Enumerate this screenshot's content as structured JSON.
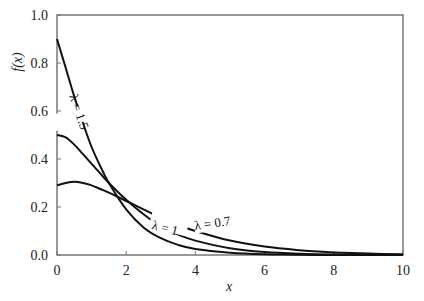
{
  "chart_data": {
    "type": "line",
    "title": "",
    "xlabel": "x",
    "ylabel": "f(x)",
    "xlim": [
      0,
      10
    ],
    "ylim": [
      0,
      1.0
    ],
    "grid": false,
    "legend": "inline curve labels",
    "x_ticks": [
      "0",
      "2",
      "4",
      "6",
      "8",
      "10"
    ],
    "y_ticks": [
      "0.0",
      "0.2",
      "0.4",
      "0.6",
      "0.8",
      "1.0"
    ],
    "x": [
      0,
      0.25,
      0.5,
      0.75,
      1,
      1.25,
      1.5,
      2,
      2.5,
      3,
      3.5,
      4,
      5,
      6,
      7,
      8,
      9,
      10
    ],
    "series": [
      {
        "name": "λ = 1.5",
        "label": "λ = 1.5",
        "values": [
          0.9,
          0.78,
          0.66,
          0.55,
          0.45,
          0.37,
          0.3,
          0.19,
          0.115,
          0.07,
          0.042,
          0.025,
          0.009,
          0.003,
          0.001,
          0.0,
          0.0,
          0.0
        ]
      },
      {
        "name": "λ = 1",
        "label": "λ = 1",
        "values": [
          0.5,
          0.49,
          0.46,
          0.42,
          0.38,
          0.34,
          0.3,
          0.23,
          0.17,
          0.12,
          0.085,
          0.06,
          0.028,
          0.012,
          0.005,
          0.002,
          0.001,
          0.0
        ]
      },
      {
        "name": "λ = 0.7",
        "label": "λ = 0.7",
        "values": [
          0.29,
          0.3,
          0.305,
          0.3,
          0.29,
          0.275,
          0.26,
          0.225,
          0.19,
          0.155,
          0.125,
          0.1,
          0.06,
          0.035,
          0.02,
          0.011,
          0.006,
          0.003
        ]
      }
    ]
  },
  "labels": {
    "ylabel": "f(x)",
    "xlabel": "x",
    "curve_15": "λ = 1.5",
    "curve_1": "λ = 1",
    "curve_07": "λ = 0.7"
  }
}
